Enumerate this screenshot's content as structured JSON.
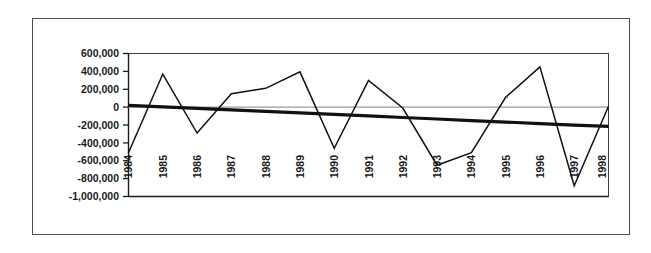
{
  "chart_data": {
    "type": "line",
    "title": "",
    "subtitle": "",
    "xlabel": "",
    "ylabel": "",
    "grid": false,
    "legend": "none",
    "categories": [
      "1984",
      "1985",
      "1986",
      "1987",
      "1988",
      "1989",
      "1990",
      "1991",
      "1992",
      "1993",
      "1994",
      "1995",
      "1996",
      "1997",
      "1998"
    ],
    "ylim": [
      -1000000,
      600000
    ],
    "ytick_step": 200000,
    "ytick_labels": [
      "600,000",
      "400,000",
      "200,000",
      "0",
      "-200,000",
      "-400,000",
      "-600,000",
      "-800,000",
      "-1,000,000"
    ],
    "ytick_values": [
      600000,
      400000,
      200000,
      0,
      -200000,
      -400000,
      -600000,
      -800000,
      -1000000
    ],
    "zero_reference_line": 0,
    "series": [
      {
        "name": "annual-series",
        "type": "line",
        "values": [
          -510000,
          370000,
          -290000,
          150000,
          210000,
          395000,
          -460000,
          300000,
          -10000,
          -650000,
          -510000,
          110000,
          450000,
          -880000,
          10000
        ]
      },
      {
        "name": "trend-line",
        "type": "line",
        "values": [
          20000,
          3000,
          -14000,
          -31000,
          -48000,
          -65000,
          -82000,
          -99000,
          -116000,
          -133000,
          -150000,
          -167000,
          -184000,
          -201000,
          -215000
        ]
      }
    ]
  },
  "figure": {
    "outer_border_color": "#4d4d4d",
    "plot_border_color": "#3d3d3d",
    "series_color": "#111111",
    "zero_line_color": "#9a9a9a",
    "background_color": "#ffffff"
  }
}
